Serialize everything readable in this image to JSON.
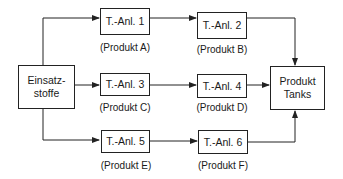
{
  "diagram": {
    "source": {
      "line1": "Einsatz-",
      "line2": "stoffe"
    },
    "target": {
      "line1": "Produkt",
      "line2": "Tanks"
    },
    "plants": [
      {
        "name": "T.-Anl. 1",
        "product": "(Produkt A)"
      },
      {
        "name": "T.-Anl. 2",
        "product": "(Produkt B)"
      },
      {
        "name": "T.-Anl. 3",
        "product": "(Produkt C)"
      },
      {
        "name": "T.-Anl. 4",
        "product": "(Produkt D)"
      },
      {
        "name": "T.-Anl. 5",
        "product": "(Produkt E)"
      },
      {
        "name": "T.-Anl. 6",
        "product": "(Produkt F)"
      }
    ],
    "edges": [
      [
        "source",
        "T.-Anl. 1"
      ],
      [
        "T.-Anl. 1",
        "T.-Anl. 2"
      ],
      [
        "T.-Anl. 2",
        "target"
      ],
      [
        "source",
        "T.-Anl. 3"
      ],
      [
        "T.-Anl. 3",
        "T.-Anl. 4"
      ],
      [
        "T.-Anl. 4",
        "target"
      ],
      [
        "source",
        "T.-Anl. 5"
      ],
      [
        "T.-Anl. 5",
        "T.-Anl. 6"
      ],
      [
        "T.-Anl. 6",
        "target"
      ]
    ]
  }
}
